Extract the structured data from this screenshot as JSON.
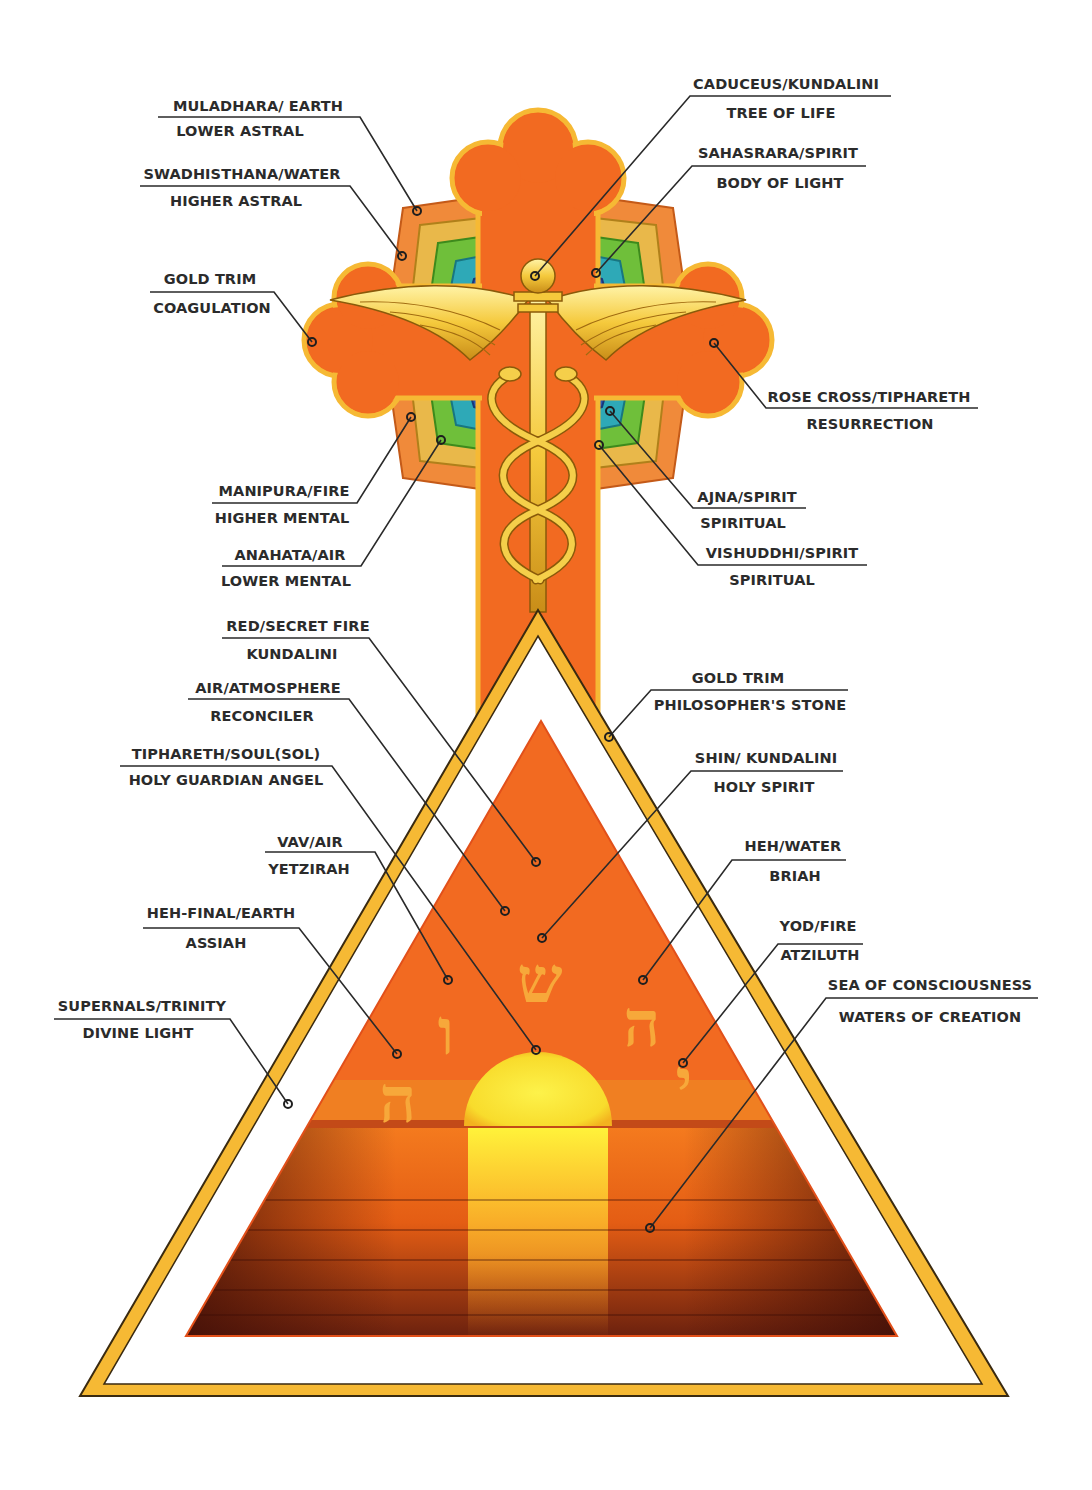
{
  "diagram": {
    "type": "labeled esoteric illustration",
    "elements": [
      "Rose Cross",
      "Caduceus",
      "Chakra lotus petals",
      "Gold-trimmed triangle",
      "Inner fire triangle",
      "Sunset over sea",
      "Hebrew letters Yod Heh Shin Vav Heh"
    ]
  },
  "colors": {
    "cross_orange": "#f26a21",
    "gold_trim": "#f6b934",
    "gold_dark": "#c88a14",
    "sun_yellow": "#fbe43a",
    "sea_dark": "#5a1a0c",
    "label_text": "#2b2b2b",
    "hebrew_letters": "#f7a83a"
  },
  "hebrew": {
    "shin": "ש",
    "heh": "ה",
    "vav": "ו",
    "heh_final": "ה",
    "yod": "י"
  },
  "labels": [
    {
      "id": "muladhara",
      "line1": "MULADHARA/ EARTH",
      "line2": "LOWER ASTRAL"
    },
    {
      "id": "swadhisthana",
      "line1": "SWADHISTHANA/WATER",
      "line2": "HIGHER ASTRAL"
    },
    {
      "id": "gold-trim-cross",
      "line1": "GOLD TRIM",
      "line2": "COAGULATION"
    },
    {
      "id": "manipura",
      "line1": "MANIPURA/FIRE",
      "line2": "HIGHER MENTAL"
    },
    {
      "id": "anahata",
      "line1": "ANAHATA/AIR",
      "line2": "LOWER MENTAL"
    },
    {
      "id": "caduceus",
      "line1": "CADUCEUS/KUNDALINI",
      "line2": "TREE OF LIFE"
    },
    {
      "id": "sahasrara",
      "line1": "SAHASRARA/SPIRIT",
      "line2": "BODY OF LIGHT"
    },
    {
      "id": "rose-cross",
      "line1": "ROSE CROSS/TIPHARETH",
      "line2": "RESURRECTION"
    },
    {
      "id": "ajna",
      "line1": "AJNA/SPIRIT",
      "line2": "SPIRITUAL"
    },
    {
      "id": "vishuddhi",
      "line1": "VISHUDDHI/SPIRIT",
      "line2": "SPIRITUAL"
    },
    {
      "id": "red-secret-fire",
      "line1": "RED/SECRET FIRE",
      "line2": "KUNDALINI"
    },
    {
      "id": "air-atmosphere",
      "line1": "AIR/ATMOSPHERE",
      "line2": "RECONCILER"
    },
    {
      "id": "tiphareth-soul",
      "line1": "TIPHARETH/SOUL(SOL)",
      "line2": "HOLY GUARDIAN ANGEL"
    },
    {
      "id": "vav-air",
      "line1": "VAV/AIR",
      "line2": "YETZIRAH"
    },
    {
      "id": "heh-final-earth",
      "line1": "HEH-FINAL/EARTH",
      "line2": "ASSIAH"
    },
    {
      "id": "supernals",
      "line1": "SUPERNALS/TRINITY",
      "line2": "DIVINE LIGHT"
    },
    {
      "id": "gold-trim-triangle",
      "line1": "GOLD TRIM",
      "line2": "PHILOSOPHER'S STONE"
    },
    {
      "id": "shin-kundalini",
      "line1": "SHIN/ KUNDALINI",
      "line2": "HOLY SPIRIT"
    },
    {
      "id": "heh-water",
      "line1": "HEH/WATER",
      "line2": "BRIAH"
    },
    {
      "id": "yod-fire",
      "line1": "YOD/FIRE",
      "line2": "ATZILUTH"
    },
    {
      "id": "sea-of-consciousness",
      "line1": "SEA OF CONSCIOUSNESS",
      "line2": "WATERS OF CREATION"
    }
  ]
}
